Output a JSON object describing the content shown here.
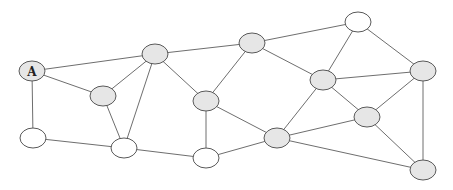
{
  "diagram": {
    "type": "undirected-graph",
    "colors": {
      "gray": "#e6e6e6",
      "white": "#ffffff"
    },
    "nodes": [
      {
        "id": "n0",
        "label": "A",
        "x": 32,
        "y": 71,
        "fill": "gray"
      },
      {
        "id": "n1",
        "label": "",
        "x": 33,
        "y": 138,
        "fill": "white"
      },
      {
        "id": "n2",
        "label": "",
        "x": 103,
        "y": 96,
        "fill": "gray"
      },
      {
        "id": "n3",
        "label": "",
        "x": 124,
        "y": 148,
        "fill": "white"
      },
      {
        "id": "n4",
        "label": "",
        "x": 155,
        "y": 54,
        "fill": "gray"
      },
      {
        "id": "n5",
        "label": "",
        "x": 206,
        "y": 101,
        "fill": "gray"
      },
      {
        "id": "n6",
        "label": "",
        "x": 206,
        "y": 158,
        "fill": "white"
      },
      {
        "id": "n7",
        "label": "",
        "x": 252,
        "y": 43,
        "fill": "gray"
      },
      {
        "id": "n8",
        "label": "",
        "x": 358,
        "y": 22,
        "fill": "white"
      },
      {
        "id": "n9",
        "label": "",
        "x": 323,
        "y": 80,
        "fill": "gray"
      },
      {
        "id": "n10",
        "label": "",
        "x": 277,
        "y": 138,
        "fill": "gray"
      },
      {
        "id": "n11",
        "label": "",
        "x": 367,
        "y": 117,
        "fill": "gray"
      },
      {
        "id": "n12",
        "label": "",
        "x": 423,
        "y": 71,
        "fill": "gray"
      },
      {
        "id": "n13",
        "label": "",
        "x": 423,
        "y": 170,
        "fill": "gray"
      }
    ],
    "edges": [
      [
        "n0",
        "n4"
      ],
      [
        "n0",
        "n2"
      ],
      [
        "n0",
        "n1"
      ],
      [
        "n1",
        "n3"
      ],
      [
        "n2",
        "n4"
      ],
      [
        "n2",
        "n3"
      ],
      [
        "n3",
        "n4"
      ],
      [
        "n3",
        "n6"
      ],
      [
        "n4",
        "n7"
      ],
      [
        "n4",
        "n5"
      ],
      [
        "n5",
        "n6"
      ],
      [
        "n5",
        "n10"
      ],
      [
        "n5",
        "n7"
      ],
      [
        "n6",
        "n10"
      ],
      [
        "n7",
        "n8"
      ],
      [
        "n7",
        "n9"
      ],
      [
        "n8",
        "n9"
      ],
      [
        "n8",
        "n12"
      ],
      [
        "n9",
        "n12"
      ],
      [
        "n9",
        "n11"
      ],
      [
        "n9",
        "n10"
      ],
      [
        "n10",
        "n11"
      ],
      [
        "n10",
        "n13"
      ],
      [
        "n11",
        "n12"
      ],
      [
        "n11",
        "n13"
      ],
      [
        "n12",
        "n13"
      ]
    ]
  }
}
